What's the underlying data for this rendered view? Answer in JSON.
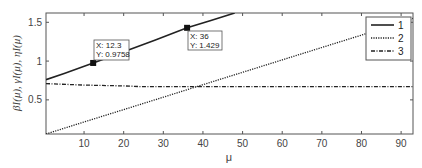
{
  "chart_data": {
    "type": "line",
    "title": "",
    "xlabel": "μ",
    "ylabel": "β_I(μ), γ_I(μ), η_I(μ)",
    "xlim": [
      0.4,
      93
    ],
    "ylim": [
      0.06,
      1.62
    ],
    "xticks": [
      10,
      20,
      30,
      40,
      50,
      60,
      70,
      80,
      90
    ],
    "yticks": [
      0.5,
      1,
      1.5
    ],
    "xtick_labels": [
      "10",
      "20",
      "30",
      "40",
      "50",
      "60",
      "70",
      "80",
      "90"
    ],
    "ytick_labels": [
      "0.5",
      "1",
      "1.5"
    ],
    "grid": false,
    "legend_position": "upper right",
    "series": [
      {
        "name": "1",
        "style": "solid",
        "x": [
          0.4,
          5,
          12.3,
          20,
          28,
          36,
          42,
          48
        ],
        "y": [
          0.76,
          0.84,
          0.9758,
          1.12,
          1.27,
          1.429,
          1.525,
          1.62
        ]
      },
      {
        "name": "2",
        "style": "dotted",
        "x": [
          0.4,
          10,
          20,
          30,
          40,
          50,
          60,
          70,
          80,
          93
        ],
        "y": [
          0.06,
          0.215,
          0.375,
          0.535,
          0.695,
          0.855,
          1.015,
          1.175,
          1.335,
          1.55
        ]
      },
      {
        "name": "3",
        "style": "dashdot",
        "x": [
          0.4,
          10,
          20,
          25,
          30,
          40,
          50,
          60,
          70,
          80,
          93
        ],
        "y": [
          0.71,
          0.69,
          0.68,
          0.67,
          0.67,
          0.67,
          0.67,
          0.67,
          0.67,
          0.67,
          0.67
        ]
      }
    ],
    "annotations": [
      {
        "type": "datatip",
        "series": "1",
        "x": 12.3,
        "y": 0.9758,
        "x_label": "X: 12.3",
        "y_label": "Y: 0.9758"
      },
      {
        "type": "datatip",
        "series": "1",
        "x": 36,
        "y": 1.429,
        "x_label": "X: 36",
        "y_label": "Y: 1.429"
      }
    ]
  },
  "labels": {
    "xlabel": "μ",
    "ylabel": "βI(μ), γI(μ), ηI(μ)",
    "legend": [
      "1",
      "2",
      "3"
    ],
    "tip1_x": "X: 12.3",
    "tip1_y": "Y: 0.9758",
    "tip2_x": "X: 36",
    "tip2_y": "Y: 1.429"
  }
}
